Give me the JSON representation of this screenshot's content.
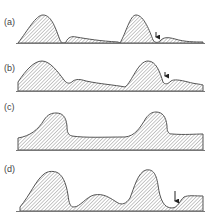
{
  "figure": {
    "panels": [
      {
        "label": "(a)",
        "label_pos": [
          4,
          25
        ],
        "baseline_y": 43,
        "path": "M18,43 C28,30 36,15 43,15 C52,15 56,30 60,40 C61,43 64,44 66,42 C68,37 72,36 76,37 C88,39 100,41 118,42 L120,43 C126,33 130,15 136,15 C144,15 150,32 153,40 C155,43 158,43 160,41 C163,37 168,37 175,39 C185,42 195,42 203,42 L203,43 Z",
        "arrow": {
          "x": 156,
          "y1": 32,
          "y2": 41
        }
      },
      {
        "label": "(b)",
        "label_pos": [
          4,
          71
        ],
        "baseline_y": 91,
        "path": "M18,82 C26,70 34,61 42,61 C50,61 58,72 64,80 C67,84 70,84 73,81 C76,79 80,79 86,81 C100,84 115,85 125,87 C132,82 138,61 148,61 C156,61 160,72 163,82 C165,85 168,84 171,81 C174,79 180,80 188,82 C195,84 200,84 203,85 L203,91 L18,91 Z",
        "arrow": {
          "x": 165,
          "y1": 72,
          "y2": 80
        }
      },
      {
        "label": "(c)",
        "label_pos": [
          4,
          110
        ],
        "baseline_y": 150,
        "path": "M18,138 C30,136 38,130 44,120 C48,114 52,113 56,113 C62,113 66,116 67,126 C67,132 68,135 72,136 C85,138 105,137 125,137 C135,136 140,128 146,118 C149,114 152,112 156,112 C162,112 166,116 167,126 C167,131 168,134 172,134 C185,135 195,134 203,134 L203,150 L18,150 Z",
        "arrow": null
      },
      {
        "label": "(d)",
        "label_pos": [
          4,
          172
        ],
        "baseline_y": 211,
        "path": "M20,207 C30,195 36,180 44,174 C48,171 52,171 56,172 C62,174 66,182 68,195 C69,203 70,207 74,207 C80,207 86,197 94,195 C104,193 110,198 118,203 C122,205 126,204 130,198 C134,188 138,172 146,170 C152,169 156,172 158,185 C160,200 164,208 172,208 C178,208 180,200 184,197 C188,195 195,196 203,196 L203,211 L20,211 Z",
        "arrow": {
          "x": 175,
          "y1": 191,
          "y2": 205
        }
      }
    ]
  },
  "colors": {
    "outline": "#555555",
    "hatch": "#9a9a9a",
    "baseline": "#777777",
    "arrow": "#222222",
    "label": "#444444"
  }
}
